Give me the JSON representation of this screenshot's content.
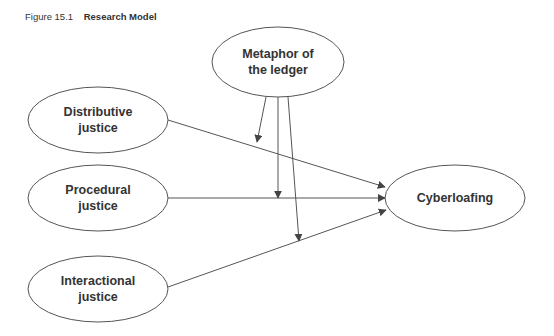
{
  "figure": {
    "number": "Figure 15.1",
    "title": "Research Model"
  },
  "nodes": {
    "moderator": {
      "line1": "Metaphor of",
      "line2": "the ledger"
    },
    "distributive": {
      "line1": "Distributive",
      "line2": "justice"
    },
    "procedural": {
      "line1": "Procedural",
      "line2": "justice"
    },
    "interactional": {
      "line1": "Interactional",
      "line2": "justice"
    },
    "outcome": {
      "line1": "Cyberloafing"
    }
  },
  "edges": [
    {
      "from": "Distributive justice",
      "to": "Cyberloafing"
    },
    {
      "from": "Procedural justice",
      "to": "Cyberloafing"
    },
    {
      "from": "Interactional justice",
      "to": "Cyberloafing"
    },
    {
      "from": "Metaphor of the ledger",
      "to": "Distributive justice → Cyberloafing",
      "type": "moderation"
    },
    {
      "from": "Metaphor of the ledger",
      "to": "Procedural justice → Cyberloafing",
      "type": "moderation"
    },
    {
      "from": "Metaphor of the ledger",
      "to": "Interactional justice → Cyberloafing",
      "type": "moderation"
    }
  ],
  "colors": {
    "stroke": "#555555",
    "text": "#333333"
  }
}
